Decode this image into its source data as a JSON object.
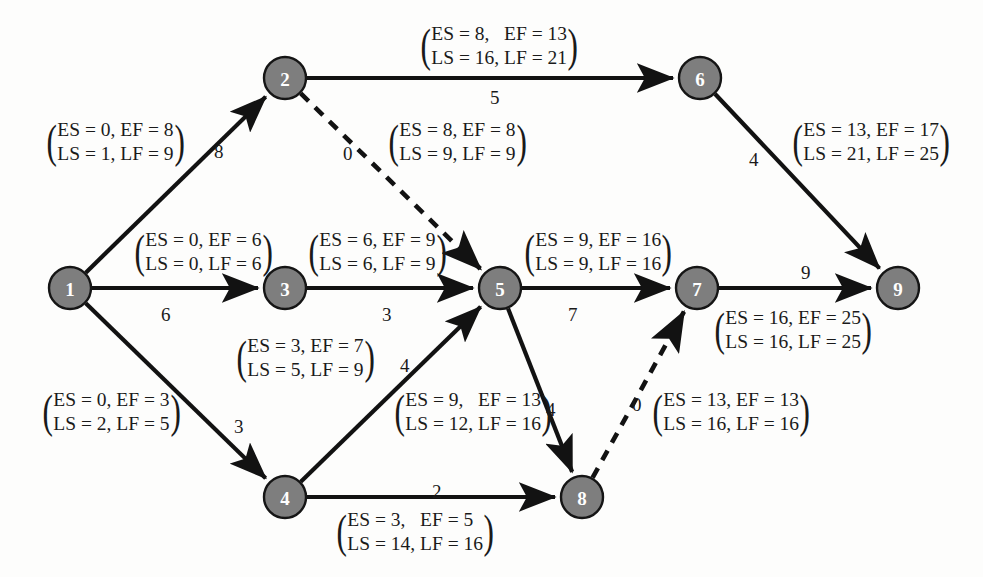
{
  "diagram": {
    "type": "project-network-aoa",
    "node_fill_color": "#7e7e7e",
    "node_text_color": "#ffffff",
    "edge_color": "#121212",
    "background_color": "#fdfdfc"
  },
  "nodes": [
    {
      "id": "n1",
      "label": "1",
      "cx": 70,
      "cy": 288,
      "r": 21
    },
    {
      "id": "n2",
      "label": "2",
      "cx": 285,
      "cy": 78,
      "r": 21
    },
    {
      "id": "n3",
      "label": "3",
      "cx": 285,
      "cy": 288,
      "r": 21
    },
    {
      "id": "n4",
      "label": "4",
      "cx": 285,
      "cy": 497,
      "r": 21
    },
    {
      "id": "n5",
      "label": "5",
      "cx": 500,
      "cy": 288,
      "r": 21
    },
    {
      "id": "n6",
      "label": "6",
      "cx": 700,
      "cy": 78,
      "r": 21
    },
    {
      "id": "n7",
      "label": "7",
      "cx": 697,
      "cy": 288,
      "r": 21
    },
    {
      "id": "n8",
      "label": "8",
      "cx": 582,
      "cy": 497,
      "r": 21
    },
    {
      "id": "n9",
      "label": "9",
      "cx": 898,
      "cy": 288,
      "r": 21
    }
  ],
  "edges": [
    {
      "id": "e12",
      "from": "n1",
      "to": "n2",
      "style": "solid",
      "duration": "8"
    },
    {
      "id": "e13",
      "from": "n1",
      "to": "n3",
      "style": "solid",
      "duration": "6"
    },
    {
      "id": "e14",
      "from": "n1",
      "to": "n4",
      "style": "solid",
      "duration": "3"
    },
    {
      "id": "e26",
      "from": "n2",
      "to": "n6",
      "style": "solid",
      "duration": "5"
    },
    {
      "id": "e25",
      "from": "n2",
      "to": "n5",
      "style": "dashed",
      "duration": "0"
    },
    {
      "id": "e35",
      "from": "n3",
      "to": "n5",
      "style": "solid",
      "duration": "3"
    },
    {
      "id": "e45",
      "from": "n4",
      "to": "n5",
      "style": "solid",
      "duration": "4"
    },
    {
      "id": "e48",
      "from": "n4",
      "to": "n8",
      "style": "solid",
      "duration": "2"
    },
    {
      "id": "e57",
      "from": "n5",
      "to": "n7",
      "style": "solid",
      "duration": "7"
    },
    {
      "id": "e58",
      "from": "n5",
      "to": "n8",
      "style": "solid",
      "duration": "4"
    },
    {
      "id": "e69",
      "from": "n6",
      "to": "n9",
      "style": "solid",
      "duration": "4"
    },
    {
      "id": "e87",
      "from": "n8",
      "to": "n7",
      "style": "dashed",
      "duration": "0"
    },
    {
      "id": "e79",
      "from": "n7",
      "to": "n9",
      "style": "solid",
      "duration": "9"
    }
  ],
  "duration_labels": [
    {
      "id": "d12",
      "edge": "e12",
      "text": "8",
      "x": 214,
      "y": 142
    },
    {
      "id": "d13",
      "edge": "e13",
      "text": "6",
      "x": 161,
      "y": 305
    },
    {
      "id": "d14",
      "edge": "e14",
      "text": "3",
      "x": 234,
      "y": 417
    },
    {
      "id": "d26",
      "edge": "e26",
      "text": "5",
      "x": 490,
      "y": 88
    },
    {
      "id": "d25",
      "edge": "e25",
      "text": "0",
      "x": 343,
      "y": 144
    },
    {
      "id": "d35",
      "edge": "e35",
      "text": "3",
      "x": 382,
      "y": 305
    },
    {
      "id": "d45",
      "edge": "e45",
      "text": "4",
      "x": 400,
      "y": 356
    },
    {
      "id": "d48",
      "edge": "e48",
      "text": "2",
      "x": 432,
      "y": 482
    },
    {
      "id": "d57",
      "edge": "e57",
      "text": "7",
      "x": 568,
      "y": 305
    },
    {
      "id": "d58",
      "edge": "e58",
      "text": "4",
      "x": 546,
      "y": 400
    },
    {
      "id": "d69",
      "edge": "e69",
      "text": "4",
      "x": 749,
      "y": 150
    },
    {
      "id": "d87",
      "edge": "e87",
      "text": "0",
      "x": 632,
      "y": 395
    },
    {
      "id": "d79",
      "edge": "e79",
      "text": "9",
      "x": 801,
      "y": 263
    }
  ],
  "schedule_labels": [
    {
      "id": "s12",
      "edge": "e12",
      "x": 44,
      "y": 118,
      "line1": "ES = 0, EF = 8",
      "line2": "LS = 1, LF = 9",
      "values": {
        "ES": 0,
        "EF": 8,
        "LS": 1,
        "LF": 9
      }
    },
    {
      "id": "s26",
      "edge": "e26",
      "x": 418,
      "y": 22,
      "line1": "ES = 8,   EF = 13",
      "line2": "LS = 16, LF = 21",
      "values": {
        "ES": 8,
        "EF": 13,
        "LS": 16,
        "LF": 21
      }
    },
    {
      "id": "s25",
      "edge": "e25",
      "x": 386,
      "y": 118,
      "line1": "ES = 8, EF = 8",
      "line2": "LS = 9, LF = 9",
      "values": {
        "ES": 8,
        "EF": 8,
        "LS": 9,
        "LF": 9
      }
    },
    {
      "id": "s69",
      "edge": "e69",
      "x": 790,
      "y": 118,
      "line1": "ES = 13, EF = 17",
      "line2": "LS = 21, LF = 25",
      "values": {
        "ES": 13,
        "EF": 17,
        "LS": 21,
        "LF": 25
      }
    },
    {
      "id": "s13",
      "edge": "e13",
      "x": 132,
      "y": 228,
      "line1": "ES = 0, EF = 6",
      "line2": "LS = 0, LF = 6",
      "values": {
        "ES": 0,
        "EF": 6,
        "LS": 0,
        "LF": 6
      }
    },
    {
      "id": "s35",
      "edge": "e35",
      "x": 306,
      "y": 228,
      "line1": "ES = 6, EF = 9",
      "line2": "LS = 6, LF = 9",
      "values": {
        "ES": 6,
        "EF": 9,
        "LS": 6,
        "LF": 9
      }
    },
    {
      "id": "s57",
      "edge": "e57",
      "x": 522,
      "y": 228,
      "line1": "ES = 9, EF = 16",
      "line2": "LS = 9, LF = 16",
      "values": {
        "ES": 9,
        "EF": 16,
        "LS": 9,
        "LF": 16
      }
    },
    {
      "id": "s79",
      "edge": "e79",
      "x": 712,
      "y": 306,
      "line1": "ES = 16, EF = 25",
      "line2": "LS = 16, LF = 25",
      "values": {
        "ES": 16,
        "EF": 25,
        "LS": 16,
        "LF": 25
      }
    },
    {
      "id": "s45",
      "edge": "e45",
      "x": 234,
      "y": 334,
      "line1": "ES = 3, EF = 7",
      "line2": "LS = 5, LF = 9",
      "values": {
        "ES": 3,
        "EF": 7,
        "LS": 5,
        "LF": 9
      }
    },
    {
      "id": "s14",
      "edge": "e14",
      "x": 40,
      "y": 388,
      "line1": "ES = 0, EF = 3",
      "line2": "LS = 2, LF = 5",
      "values": {
        "ES": 0,
        "EF": 3,
        "LS": 2,
        "LF": 5
      }
    },
    {
      "id": "s58",
      "edge": "e58",
      "x": 392,
      "y": 388,
      "line1": "ES = 9,   EF = 13",
      "line2": "LS = 12, LF = 16",
      "values": {
        "ES": 9,
        "EF": 13,
        "LS": 12,
        "LF": 16
      }
    },
    {
      "id": "s87",
      "edge": "e87",
      "x": 650,
      "y": 388,
      "line1": "ES = 13, EF = 13",
      "line2": "LS = 16, LF = 16",
      "values": {
        "ES": 13,
        "EF": 13,
        "LS": 16,
        "LF": 16
      }
    },
    {
      "id": "s48",
      "edge": "e48",
      "x": 334,
      "y": 508,
      "line1": "ES = 3,   EF = 5 ",
      "line2": "LS = 14, LF = 16",
      "values": {
        "ES": 3,
        "EF": 5,
        "LS": 14,
        "LF": 16
      }
    }
  ]
}
